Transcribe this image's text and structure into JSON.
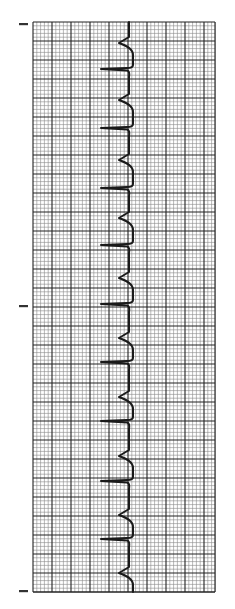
{
  "figure": {
    "type": "ecg-rhythm-strip",
    "orientation": "vertical",
    "colors": {
      "paper": "#ffffff",
      "minor_grid": "#8a8a8a",
      "major_grid": "#222222",
      "trace": "#1a1a1a",
      "marker": "#333333"
    }
  },
  "grid": {
    "left": 33,
    "top": 22,
    "right": 215,
    "bottom": 592,
    "minor_spacing": 3.8,
    "major_spacing": 19
  },
  "markers": [
    {
      "name": "top-marker",
      "y": 24
    },
    {
      "name": "middle-marker",
      "y": 306
    },
    {
      "name": "bottom-marker",
      "y": 591
    }
  ],
  "trace": {
    "baseline_x": 129,
    "beats": [
      {
        "notch_y": 43,
        "spike_y": 69
      },
      {
        "notch_y": 100,
        "spike_y": 128
      },
      {
        "notch_y": 160,
        "spike_y": 188
      },
      {
        "notch_y": 218,
        "spike_y": 245
      },
      {
        "notch_y": 278,
        "spike_y": 304
      },
      {
        "notch_y": 338,
        "spike_y": 362
      },
      {
        "notch_y": 397,
        "spike_y": 421
      },
      {
        "notch_y": 456,
        "spike_y": 481
      },
      {
        "notch_y": 515,
        "spike_y": 539
      },
      {
        "notch_y": 573,
        "spike_y": null
      }
    ]
  }
}
